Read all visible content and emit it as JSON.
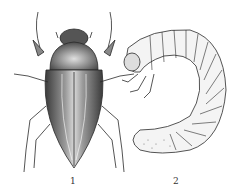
{
  "figures": [
    {
      "label": "1",
      "subject": "adult beetle (top view)"
    },
    {
      "label": "2",
      "subject": "larva (grub)"
    }
  ],
  "colors": {
    "ink": "#2a2a2a",
    "shade": "#6b6b6b",
    "paper": "#ffffff"
  }
}
